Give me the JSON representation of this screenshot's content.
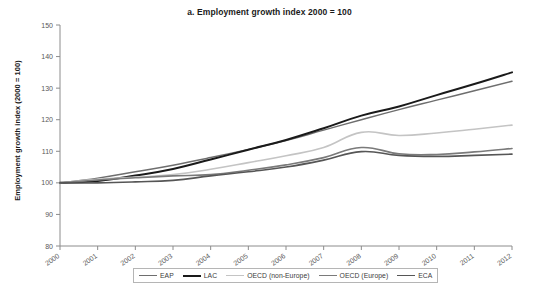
{
  "chart_data": {
    "type": "line",
    "title": "a. Employment growth index 2000 = 100",
    "xlabel": "",
    "ylabel": "Employment growth index (2000 = 100)",
    "x": [
      2000,
      2001,
      2002,
      2003,
      2004,
      2005,
      2006,
      2007,
      2008,
      2009,
      2010,
      2011,
      2012
    ],
    "categories": [
      "2000",
      "2001",
      "2002",
      "2003",
      "2004",
      "2005",
      "2006",
      "2007",
      "2008",
      "2009",
      "2010",
      "2011",
      "2012"
    ],
    "xlim": [
      2000,
      2012
    ],
    "ylim": [
      80,
      150
    ],
    "yticks": [
      80,
      90,
      100,
      110,
      120,
      130,
      140,
      150
    ],
    "ytick_labels": [
      "80",
      "90",
      "100",
      "110",
      "120",
      "130",
      "140",
      "150"
    ],
    "grid": false,
    "legend_position": "bottom",
    "series": [
      {
        "name": "EAP",
        "color": "#6e6e6e",
        "width": 1.5,
        "values": [
          100.0,
          101.5,
          103.5,
          105.6,
          108.0,
          110.6,
          113.4,
          116.7,
          120.0,
          123.2,
          126.2,
          129.2,
          132.2
        ]
      },
      {
        "name": "LAC",
        "color": "#1a1a1a",
        "width": 2.0,
        "values": [
          100.0,
          100.6,
          102.3,
          104.4,
          107.4,
          110.5,
          113.6,
          117.3,
          121.3,
          124.2,
          127.8,
          131.3,
          135.0
        ]
      },
      {
        "name": "OECD (non-Europe)",
        "color": "#c4c4c4",
        "width": 1.6,
        "values": [
          100.0,
          101.1,
          101.8,
          102.6,
          104.3,
          106.4,
          108.6,
          111.2,
          116.0,
          115.0,
          115.8,
          117.0,
          118.3
        ]
      },
      {
        "name": "OECD (Europe)",
        "color": "#7a7a7a",
        "width": 1.6,
        "values": [
          100.0,
          100.9,
          101.6,
          102.2,
          102.6,
          104.0,
          105.7,
          108.0,
          111.2,
          109.2,
          109.0,
          109.8,
          110.9
        ]
      },
      {
        "name": "ECA",
        "color": "#565656",
        "width": 1.6,
        "values": [
          100.0,
          100.0,
          100.3,
          100.8,
          102.2,
          103.5,
          105.0,
          107.2,
          109.9,
          108.7,
          108.4,
          108.7,
          109.1
        ]
      }
    ]
  },
  "legend": {
    "items": [
      {
        "label": "EAP"
      },
      {
        "label": "LAC"
      },
      {
        "label": "OECD (non-Europe)"
      },
      {
        "label": "OECD (Europe)"
      },
      {
        "label": "ECA"
      }
    ]
  },
  "axis": {
    "line_color": "#8c8c8c",
    "tick_color": "#8c8c8c",
    "label_color": "#595959"
  }
}
